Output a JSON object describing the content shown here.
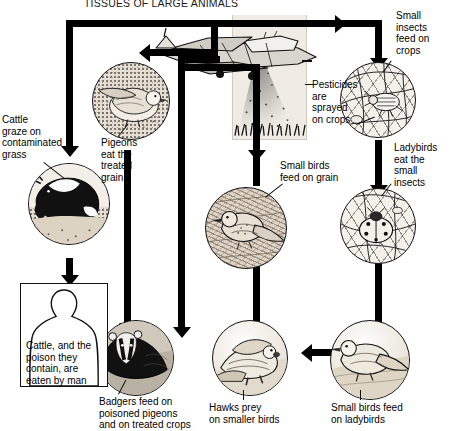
{
  "diagram": {
    "title": "TISSUES OF LARGE ANIMALS",
    "type": "food-chain / pesticide bioaccumulation cycle",
    "labels": {
      "cattle_graze": "Cattle\ngraze on\ncontaminated\ngrass",
      "pigeons_grain": "Pigeons\neat the\ntreated\ngrain",
      "pesticides_sprayed": "Pesticides\nare\nsprayed\non crops",
      "small_insects": "Small\ninsects\nfeed on\ncrops",
      "ladybirds": "Ladybirds\neat the\nsmall\ninsects",
      "small_birds_grain": "Small birds\nfeed on grain",
      "man_box": "Cattle, and the\npoison they\ncontain, are\neaten by man",
      "badgers": "Badgers feed on\npoisoned pigeons\nand on treated crops",
      "hawks": "Hawks prey\non smaller birds",
      "small_birds_ladybirds": "Small birds feed\non ladybirds"
    },
    "vignettes": [
      {
        "name": "pigeon",
        "subject": "Pigeon perched on treated grain"
      },
      {
        "name": "cattle",
        "subject": "Holstein cow grazing on contaminated grass"
      },
      {
        "name": "crop-insects",
        "subject": "Small insects feeding on crop leaves"
      },
      {
        "name": "ladybird",
        "subject": "Ladybird eating small insects on a leaf"
      },
      {
        "name": "small-bird",
        "subject": "Small bird feeding on grain"
      },
      {
        "name": "badger",
        "subject": "Badger feeding on poisoned pigeons and treated crops"
      },
      {
        "name": "hawk",
        "subject": "Hawk preying on smaller birds"
      },
      {
        "name": "small-bird-ladybirds",
        "subject": "Small bird feeding on ladybirds"
      },
      {
        "name": "crop-duster",
        "subject": "Crop-duster aeroplane spraying pesticide over a field"
      }
    ],
    "colors": {
      "ink": "#000000",
      "background": "#ffffff",
      "illustration_base": "#e8dfd0",
      "panel": "#f0ece5"
    }
  }
}
